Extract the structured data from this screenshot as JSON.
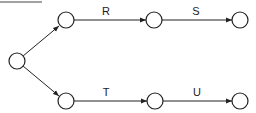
{
  "diagram": {
    "type": "activity-network",
    "colors": {
      "stroke": "#222222",
      "background": "#ffffff"
    },
    "nodes": [
      {
        "id": "start",
        "x": 17,
        "y": 61
      },
      {
        "id": "a1",
        "x": 66,
        "y": 20
      },
      {
        "id": "a2",
        "x": 154,
        "y": 20
      },
      {
        "id": "a3",
        "x": 240,
        "y": 20
      },
      {
        "id": "b1",
        "x": 66,
        "y": 101
      },
      {
        "id": "b2",
        "x": 155,
        "y": 101
      },
      {
        "id": "b3",
        "x": 240,
        "y": 101
      }
    ],
    "edges": [
      {
        "from": "start",
        "to": "a1",
        "label": ""
      },
      {
        "from": "start",
        "to": "b1",
        "label": ""
      },
      {
        "from": "a1",
        "to": "a2",
        "label": "R"
      },
      {
        "from": "a2",
        "to": "a3",
        "label": "S"
      },
      {
        "from": "b1",
        "to": "b2",
        "label": "T"
      },
      {
        "from": "b2",
        "to": "b3",
        "label": "U"
      }
    ]
  }
}
